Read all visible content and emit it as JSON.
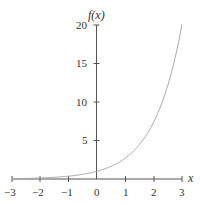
{
  "chart_data": {
    "type": "line",
    "title": "",
    "xlabel": "x",
    "ylabel": "f(x)",
    "xlim": [
      -3,
      3
    ],
    "ylim": [
      0,
      20
    ],
    "x_ticks": [
      "-3",
      "-2",
      "-1",
      "0",
      "1",
      "2",
      "3"
    ],
    "y_ticks": [
      "5",
      "10",
      "15",
      "20"
    ],
    "grid": false,
    "legend": null,
    "series": [
      {
        "name": "f(x) = e^x",
        "x": [
          -3,
          -2,
          -1,
          0,
          1,
          2,
          3
        ],
        "values": [
          0.05,
          0.14,
          0.37,
          1,
          2.72,
          7.39,
          20.09
        ]
      }
    ]
  },
  "labels": {
    "xlabel": "x",
    "ylabel": "f(x)",
    "xt0": "−3",
    "xt1": "−2",
    "xt2": "−1",
    "xt3": "0",
    "xt4": "1",
    "xt5": "2",
    "xt6": "3",
    "yt5": "5",
    "yt10": "10",
    "yt15": "15",
    "yt20": "20"
  },
  "colors": {
    "axis": "#555555",
    "curve": "#aaaaaa"
  }
}
